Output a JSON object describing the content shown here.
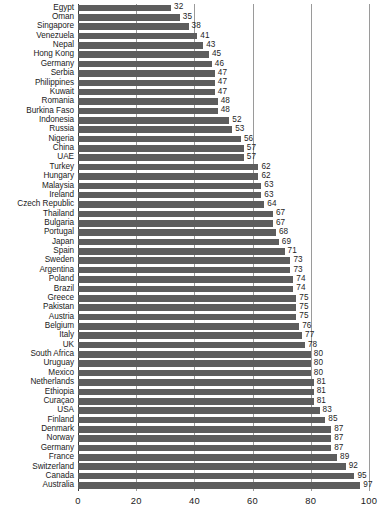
{
  "chart_data": {
    "type": "bar",
    "orientation": "horizontal",
    "title": "",
    "subtitle": "",
    "xlabel": "",
    "ylabel": "",
    "xlim": [
      0,
      100
    ],
    "grid": true,
    "gridlines": [
      0,
      20,
      40,
      60,
      80,
      100
    ],
    "legend": null,
    "xticks": [
      "0",
      "20",
      "40",
      "60",
      "80",
      "100"
    ],
    "xtick_values": [
      0,
      20,
      40,
      60,
      80,
      100
    ],
    "bar_color": "#5d5d5d",
    "categories": [
      "Egypt",
      "Oman",
      "Singapore",
      "Venezuela",
      "Nepal",
      "Hong Kong",
      "Germany",
      "Serbia",
      "Philippines",
      "Kuwait",
      "Romania",
      "Burkina Faso",
      "Indonesia",
      "Russia",
      "Nigeria",
      "China",
      "UAE",
      "Turkey",
      "Hungary",
      "Malaysia",
      "Ireland",
      "Czech Republic",
      "Thailand",
      "Bulgaria",
      "Portugal",
      "Japan",
      "Spain",
      "Sweden",
      "Argentina",
      "Poland",
      "Brazil",
      "Greece",
      "Pakistan",
      "Austria",
      "Belgium",
      "Italy",
      "UK",
      "South Africa",
      "Uruguay",
      "Mexico",
      "Netherlands",
      "Ethiopia",
      "Curaçao",
      "USA",
      "Finland",
      "Denmark",
      "Norway",
      "Germany",
      "France",
      "Switzerland",
      "Canada",
      "Australia"
    ],
    "values": [
      32,
      35,
      38,
      41,
      43,
      45,
      46,
      47,
      47,
      47,
      48,
      48,
      52,
      53,
      56,
      57,
      57,
      62,
      62,
      63,
      63,
      64,
      67,
      67,
      68,
      69,
      71,
      73,
      73,
      74,
      74,
      75,
      75,
      75,
      76,
      77,
      78,
      80,
      80,
      80,
      81,
      81,
      81,
      83,
      85,
      87,
      87,
      87,
      89,
      92,
      95,
      97
    ],
    "data_labels": [
      "32",
      "35",
      "38",
      "41",
      "43",
      "45",
      "46",
      "47",
      "47",
      "47",
      "48",
      "48",
      "52",
      "53",
      "56",
      "57",
      "57",
      "62",
      "62",
      "63",
      "63",
      "64",
      "67",
      "67",
      "68",
      "69",
      "71",
      "73",
      "73",
      "74",
      "74",
      "75",
      "75",
      "75",
      "76",
      "77",
      "78",
      "80",
      "80",
      "80",
      "81",
      "81",
      "81",
      "83",
      "85",
      "87",
      "87",
      "87",
      "89",
      "92",
      "95",
      "97"
    ]
  }
}
